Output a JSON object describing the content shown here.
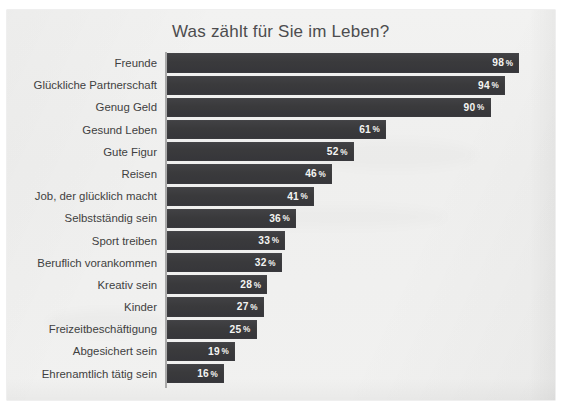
{
  "chart_data": {
    "type": "bar",
    "orientation": "horizontal",
    "title": "Was zählt für Sie im Leben?",
    "xlabel": "",
    "ylabel": "",
    "unit": "%",
    "xlim": [
      0,
      100
    ],
    "grid": false,
    "legend": "none",
    "categories": [
      "Freunde",
      "Glückliche Partnerschaft",
      "Genug Geld",
      "Gesund Leben",
      "Gute Figur",
      "Reisen",
      "Job, der glücklich macht",
      "Selbstständig sein",
      "Sport treiben",
      "Beruflich vorankommen",
      "Kreativ sein",
      "Kinder",
      "Freizeitbeschäftigung",
      "Abgesichert sein",
      "Ehrenamtlich tätig sein"
    ],
    "values": [
      98,
      94,
      90,
      61,
      52,
      46,
      41,
      36,
      33,
      32,
      28,
      27,
      25,
      19,
      16
    ],
    "value_labels": [
      "98 %",
      "94 %",
      "90 %",
      "61 %",
      "52 %",
      "46 %",
      "41 %",
      "36 %",
      "33 %",
      "32 %",
      "28 %",
      "27 %",
      "25 %",
      "19 %",
      "16 %"
    ],
    "bars": [
      {
        "label": "Freunde",
        "value": 98,
        "value_text": "98",
        "unit": "%"
      },
      {
        "label": "Glückliche Partnerschaft",
        "value": 94,
        "value_text": "94",
        "unit": "%"
      },
      {
        "label": "Genug Geld",
        "value": 90,
        "value_text": "90",
        "unit": "%"
      },
      {
        "label": "Gesund Leben",
        "value": 61,
        "value_text": "61",
        "unit": "%"
      },
      {
        "label": "Gute Figur",
        "value": 52,
        "value_text": "52",
        "unit": "%"
      },
      {
        "label": "Reisen",
        "value": 46,
        "value_text": "46",
        "unit": "%"
      },
      {
        "label": "Job, der glücklich macht",
        "value": 41,
        "value_text": "41",
        "unit": "%"
      },
      {
        "label": "Selbstständig sein",
        "value": 36,
        "value_text": "36",
        "unit": "%"
      },
      {
        "label": "Sport treiben",
        "value": 33,
        "value_text": "33",
        "unit": "%"
      },
      {
        "label": "Beruflich vorankommen",
        "value": 32,
        "value_text": "32",
        "unit": "%"
      },
      {
        "label": "Kreativ sein",
        "value": 28,
        "value_text": "28",
        "unit": "%"
      },
      {
        "label": "Kinder",
        "value": 27,
        "value_text": "27",
        "unit": "%"
      },
      {
        "label": "Freizeitbeschäftigung",
        "value": 25,
        "value_text": "25",
        "unit": "%"
      },
      {
        "label": "Abgesichert sein",
        "value": 19,
        "value_text": "19",
        "unit": "%"
      },
      {
        "label": "Ehrenamtlich tätig sein",
        "value": 16,
        "value_text": "16",
        "unit": "%"
      }
    ],
    "colors": {
      "bar": "#3a3a3c",
      "bar_label_text": "#f4f4f2",
      "category_label_text": "#3f3f41",
      "title_text": "#4c4c4e",
      "axis_line": "#a9a9a9",
      "paper_background": "#f1f1f0",
      "page_background": "#ffffff"
    }
  }
}
